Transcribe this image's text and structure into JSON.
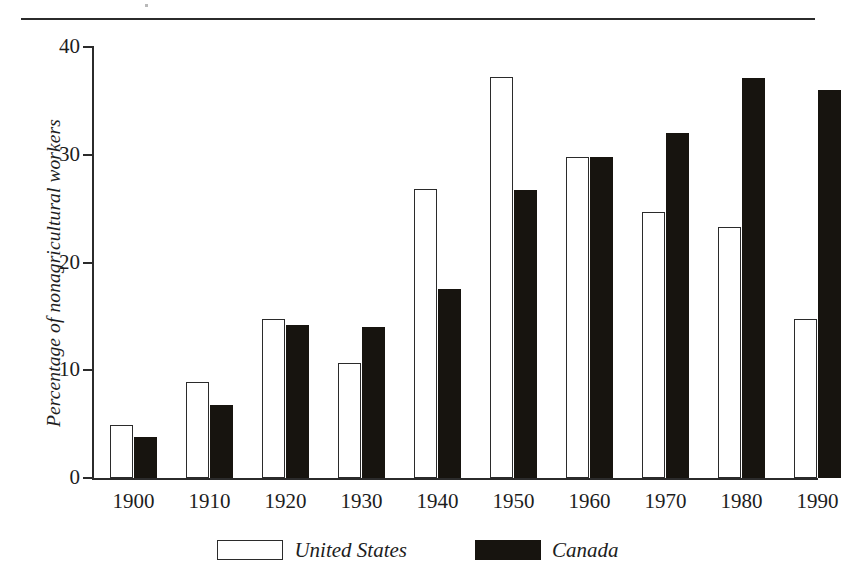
{
  "chart_data": {
    "type": "bar",
    "title": "",
    "xlabel": "",
    "ylabel": "Percentage of nonagricultural workers",
    "categories": [
      "1900",
      "1910",
      "1920",
      "1930",
      "1940",
      "1950",
      "1960",
      "1970",
      "1980",
      "1990"
    ],
    "series": [
      {
        "name": "United States",
        "values": [
          4.9,
          8.9,
          14.8,
          10.7,
          26.8,
          37.2,
          29.8,
          24.7,
          23.3,
          14.8
        ]
      },
      {
        "name": "Canada",
        "values": [
          3.8,
          6.8,
          14.2,
          14.0,
          17.5,
          26.7,
          29.8,
          32.0,
          37.1,
          36.0
        ]
      }
    ],
    "ylim": [
      0,
      40
    ],
    "y_ticks": [
      "0",
      "10",
      "20",
      "30",
      "40"
    ],
    "y_tick_values": [
      0,
      10,
      20,
      30,
      40
    ],
    "grid": false,
    "legend_position": "bottom",
    "legend_entries": [
      {
        "label": "United States",
        "swatch": "white-outlined-rect",
        "color": "#ffffff"
      },
      {
        "label": "Canada",
        "swatch": "solid-black-rect",
        "color": "#17140f"
      }
    ],
    "colors": {
      "united_states_fill": "#ffffff",
      "united_states_stroke": "#2b2b2b",
      "canada_fill": "#17140f",
      "axis": "#2b2b2b",
      "text": "#1d1d1d",
      "background": "#ffffff"
    }
  },
  "axes": {
    "y_title": "Percentage of nonagricultural workers"
  }
}
